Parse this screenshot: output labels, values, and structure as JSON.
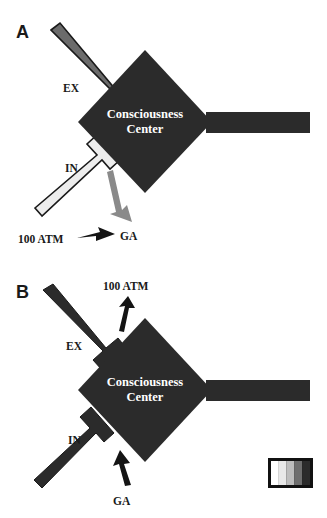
{
  "figure": {
    "background_color": "#ffffff",
    "dark_color": "#2b2b2b",
    "mid_gray_color": "#6b6b6b",
    "light_color": "#ededed",
    "outline_color": "#1a1a1a",
    "text_color": "#1a1a1a",
    "center_text_color": "#ffffff"
  },
  "panel_a": {
    "letter": "A",
    "center_line1": "Consciousness",
    "center_line2": "Center",
    "exhaust_label": "EX",
    "inlet_label": "IN",
    "gas_label": "GA",
    "pressure_label": "100 ATM",
    "exhaust_tube_color": "#6b6b6b",
    "inlet_tube_color": "#ededed",
    "gas_arrow_color": "#8a8a8a",
    "pressure_arrow_color": "#141414"
  },
  "panel_b": {
    "letter": "B",
    "center_line1": "Consciousness",
    "center_line2": "Center",
    "exhaust_label": "EX",
    "inlet_label": "IN",
    "gas_label": "GA",
    "pressure_label": "100 ATM",
    "exhaust_tube_color": "#2b2b2b",
    "inlet_tube_color": "#2b2b2b",
    "gas_arrow_color": "#141414",
    "pressure_arrow_color": "#141414"
  },
  "legend": {
    "name": "grayscale-scale-bar",
    "swatches": [
      "#ffffff",
      "#e8e8e8",
      "#bdbdbd",
      "#6e6e6e",
      "#2b2b2b"
    ],
    "border_color": "#111111"
  }
}
